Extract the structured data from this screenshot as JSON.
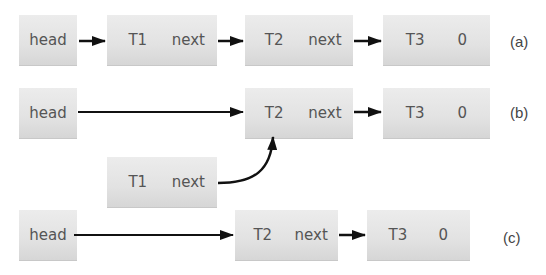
{
  "diagram": {
    "rows": [
      {
        "id": "a",
        "label": "(a)",
        "head": "head",
        "nodes": [
          {
            "id": "T1",
            "name": "T1",
            "field": "next"
          },
          {
            "id": "T2",
            "name": "T2",
            "field": "next"
          },
          {
            "id": "T3",
            "name": "T3",
            "field": "0"
          }
        ]
      },
      {
        "id": "b",
        "label": "(b)",
        "head": "head",
        "nodes": [
          {
            "id": "T2",
            "name": "T2",
            "field": "next"
          },
          {
            "id": "T3",
            "name": "T3",
            "field": "0"
          }
        ],
        "detached": {
          "id": "T1",
          "name": "T1",
          "field": "next",
          "points_to": "T2"
        }
      },
      {
        "id": "c",
        "label": "(c)",
        "head": "head",
        "nodes": [
          {
            "id": "T2",
            "name": "T2",
            "field": "next"
          },
          {
            "id": "T3",
            "name": "T3",
            "field": "0"
          }
        ]
      }
    ],
    "colors": {
      "node_fill": "#e2e2e2",
      "text": "#555555",
      "arrow": "#111111"
    }
  }
}
